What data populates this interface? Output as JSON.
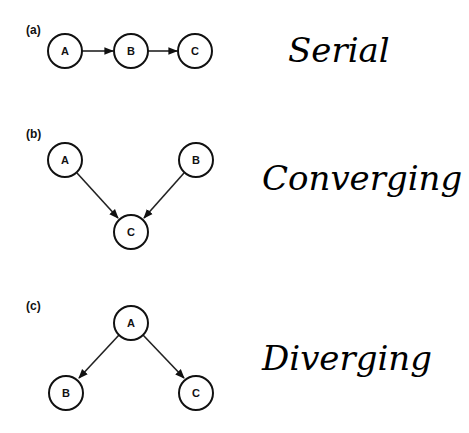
{
  "diagrams": [
    {
      "id": "a",
      "panel_label": "(a)",
      "title": "Serial",
      "nodes": [
        {
          "id": "A",
          "label": "A",
          "cx": 65,
          "cy": 51
        },
        {
          "id": "B",
          "label": "B",
          "cx": 131,
          "cy": 51
        },
        {
          "id": "C",
          "label": "C",
          "cx": 195,
          "cy": 51
        }
      ],
      "edges": [
        [
          "A",
          "B"
        ],
        [
          "B",
          "C"
        ]
      ]
    },
    {
      "id": "b",
      "panel_label": "(b)",
      "title": "Converging",
      "nodes": [
        {
          "id": "A",
          "label": "A",
          "cx": 65,
          "cy": 160
        },
        {
          "id": "B",
          "label": "B",
          "cx": 196,
          "cy": 160
        },
        {
          "id": "C",
          "label": "C",
          "cx": 131,
          "cy": 232
        }
      ],
      "edges": [
        [
          "A",
          "C"
        ],
        [
          "B",
          "C"
        ]
      ]
    },
    {
      "id": "c",
      "panel_label": "(c)",
      "title": "Diverging",
      "nodes": [
        {
          "id": "A",
          "label": "A",
          "cx": 131,
          "cy": 323
        },
        {
          "id": "B",
          "label": "B",
          "cx": 66,
          "cy": 393
        },
        {
          "id": "C",
          "label": "C",
          "cx": 196,
          "cy": 393
        }
      ],
      "edges": [
        [
          "A",
          "B"
        ],
        [
          "A",
          "C"
        ]
      ]
    }
  ],
  "style": {
    "stroke": "#111111",
    "background": "#ffffff",
    "node_radius": 17
  }
}
